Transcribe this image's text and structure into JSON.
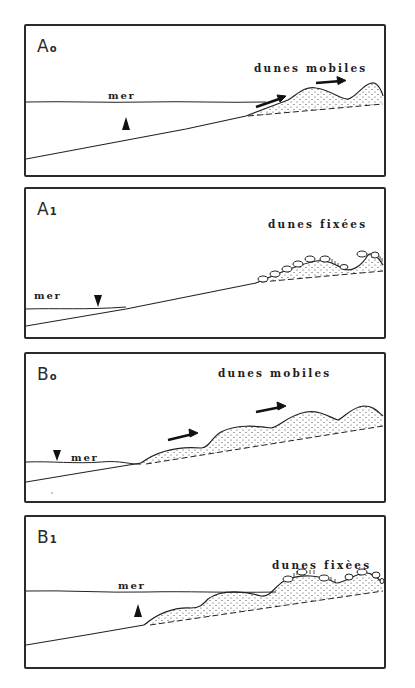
{
  "figure": {
    "panels": [
      {
        "id": "A0",
        "label_main": "A",
        "label_sub": "o",
        "dune_label": "dunes mobiles",
        "sea_label": "mer",
        "sea_level_marker": "up-arrow",
        "dune_state": "mobile",
        "wind_arrows": 2
      },
      {
        "id": "A1",
        "label_main": "A",
        "label_sub": "1",
        "dune_label": "dunes fixées",
        "sea_label": "mer",
        "sea_level_marker": "down-arrow",
        "dune_state": "fixed",
        "wind_arrows": 0
      },
      {
        "id": "B0",
        "label_main": "B",
        "label_sub": "o",
        "dune_label": "dunes mobiles",
        "sea_label": "mer",
        "sea_level_marker": "down-arrow",
        "dune_state": "mobile",
        "wind_arrows": 2
      },
      {
        "id": "B1",
        "label_main": "B",
        "label_sub": "1",
        "dune_label": "dunes fixèes",
        "sea_label": "mer",
        "sea_level_marker": "up-arrow",
        "dune_state": "fixed",
        "wind_arrows": 0
      }
    ]
  },
  "colors": {
    "ink": "#1e1e1e",
    "border": "#2a2a2a",
    "background": "#ffffff"
  }
}
